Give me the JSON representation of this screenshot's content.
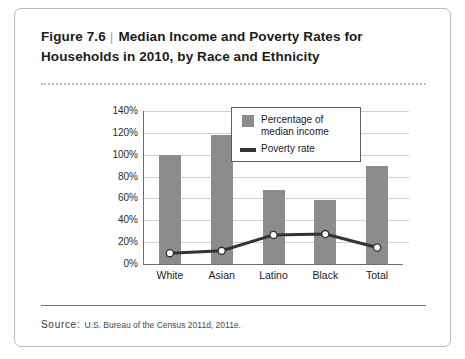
{
  "figure": {
    "number": "Figure 7.6",
    "separator": "|",
    "title_line1": "Median Income and Poverty Rates for",
    "title_line2": "Households in 2010, by Race and Ethnicity"
  },
  "source": {
    "label": "Source:",
    "text": "U.S. Bureau of the Census 2011d, 2011e."
  },
  "colors": {
    "bar": "#8c8c8c",
    "line": "#333333",
    "marker_fill": "#ffffff",
    "gridline": "#d2d2d2",
    "axis": "#6e6e6e",
    "card_border": "#b9b9b9"
  },
  "legend": {
    "position": "top-right-inside",
    "entries": [
      {
        "label_line1": "Percentage of",
        "label_line2": "median income",
        "marker": "bar-swatch"
      },
      {
        "label_line1": "Poverty rate",
        "label_line2": "",
        "marker": "line-swatch"
      }
    ]
  },
  "chart_data": {
    "type": "bar",
    "title": "Median Income and Poverty Rates for Households in 2010, by Race and Ethnicity",
    "xlabel": "",
    "ylabel": "",
    "ylim": [
      0,
      140
    ],
    "yticks": [
      "0%",
      "20%",
      "40%",
      "60%",
      "80%",
      "100%",
      "120%",
      "140%"
    ],
    "ytick_values": [
      0,
      20,
      40,
      60,
      80,
      100,
      120,
      140
    ],
    "grid": true,
    "categories": [
      "White",
      "Asian",
      "Latino",
      "Black",
      "Total"
    ],
    "series": [
      {
        "name": "Percentage of median income",
        "type": "bar",
        "values": [
          100,
          118,
          68,
          59,
          90
        ]
      },
      {
        "name": "Poverty rate",
        "type": "line",
        "values": [
          9.9,
          12.1,
          26.6,
          27.4,
          15.1
        ]
      }
    ]
  }
}
